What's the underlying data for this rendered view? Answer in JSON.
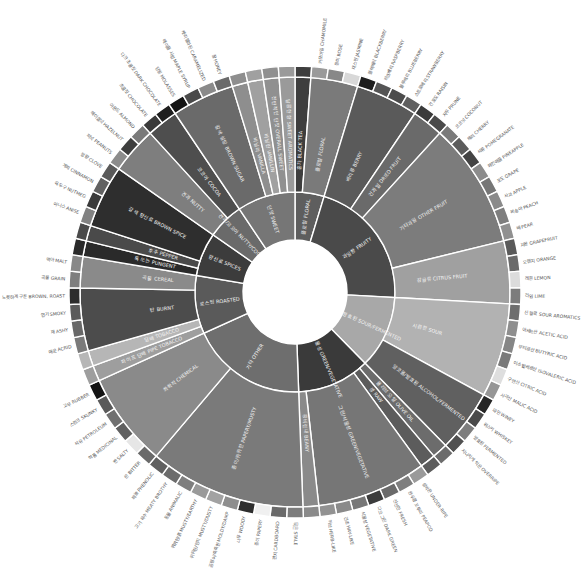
{
  "chart_data": {
    "type": "sunburst",
    "title": "",
    "center": [
      295,
      292
    ],
    "rings": {
      "hole_radius": 52,
      "inner": [
        52,
        100
      ],
      "middle": [
        100,
        215
      ],
      "outer_band": [
        215,
        226
      ],
      "label_radius": 230
    },
    "start_angle_deg": 0,
    "colors": {
      "background": "#ffffff",
      "separator": "#ffffff"
    },
    "categories": [
      {
        "ko": "플로럴",
        "en": "FLORAL",
        "color": "#5e5e5e",
        "children": [
          {
            "ko": "홍차",
            "en": "BLACK TEA",
            "color": "#3e3e3e",
            "leaves": []
          },
          {
            "ko": "플로럴",
            "en": "FLORAL",
            "color": "#7a7a7a",
            "leaves": [
              {
                "ko": "카모마일",
                "en": "CHAMOMILE",
                "color": "#9a9a9a"
              },
              {
                "ko": "장미",
                "en": "ROSE",
                "color": "#888888"
              },
              {
                "ko": "재스민",
                "en": "JASMINE",
                "color": "#d8d8d8"
              }
            ]
          }
        ]
      },
      {
        "ko": "과일향",
        "en": "FRUITY",
        "color": "#4a4a4a",
        "children": [
          {
            "ko": "베리류",
            "en": "BERRY",
            "color": "#5a5a5a",
            "leaves": [
              {
                "ko": "블랙베리",
                "en": "BLACKBERRY",
                "color": "#1e1e1e"
              },
              {
                "ko": "라즈베리",
                "en": "RASPBERRY",
                "color": "#555555"
              },
              {
                "ko": "블루베리",
                "en": "BLUEBERRY",
                "color": "#4c4c4c"
              },
              {
                "ko": "스트로베리",
                "en": "STRAWBERRY",
                "color": "#606060"
              }
            ]
          },
          {
            "ko": "건과일",
            "en": "DRIED FRUIT",
            "color": "#6a6a6a",
            "leaves": [
              {
                "ko": "건포도",
                "en": "RAISIN",
                "color": "#3a3a3a"
              },
              {
                "ko": "자두",
                "en": "PRUNE",
                "color": "#4a4a4a"
              }
            ]
          },
          {
            "ko": "기타과일",
            "en": "OTHER FRUIT",
            "color": "#7c7c7c",
            "leaves": [
              {
                "ko": "코코넛",
                "en": "COCONUT",
                "color": "#7a7a7a"
              },
              {
                "ko": "체리",
                "en": "CHERRY",
                "color": "#5c5c5c"
              },
              {
                "ko": "석류",
                "en": "POMEGRANATE",
                "color": "#444444"
              },
              {
                "ko": "파인애플",
                "en": "PINEAPPLE",
                "color": "#8c8c8c"
              },
              {
                "ko": "포도",
                "en": "GRAPE",
                "color": "#767676"
              },
              {
                "ko": "사과",
                "en": "APPLE",
                "color": "#8a8a8a"
              },
              {
                "ko": "복숭아",
                "en": "PEACH",
                "color": "#7e7e7e"
              },
              {
                "ko": "배",
                "en": "PEAR",
                "color": "#909090"
              }
            ]
          },
          {
            "ko": "감귤류",
            "en": "CITRUS FRUIT",
            "color": "#a0a0a0",
            "leaves": [
              {
                "ko": "자몽",
                "en": "GRAPEFRUIT",
                "color": "#5a5a5a"
              },
              {
                "ko": "오렌지",
                "en": "ORANGE",
                "color": "#6a6a6a"
              },
              {
                "ko": "레몬",
                "en": "LEMON",
                "color": "#dcdcdc"
              },
              {
                "ko": "라임",
                "en": "LIME",
                "color": "#7c7c7c"
              }
            ]
          }
        ]
      },
      {
        "ko": "시큼한/발효된",
        "en": "SOUR/FERMENTED",
        "color": "#a8a8a8",
        "children": [
          {
            "ko": "시큼한",
            "en": "SOUR",
            "color": "#b2b2b2",
            "leaves": [
              {
                "ko": "신 향료",
                "en": "SOUR AROMATICS",
                "color": "#6e6e6e"
              },
              {
                "ko": "아세트산",
                "en": "ACETIC ACID",
                "color": "#8e8e8e"
              },
              {
                "ko": "부티르산",
                "en": "BUTYRIC ACID",
                "color": "#868686"
              },
              {
                "ko": "이소발레르산",
                "en": "ISOVALERIC ACID",
                "color": "#7a7a7a"
              },
              {
                "ko": "구연산",
                "en": "CITRIC ACID",
                "color": "#dedede"
              },
              {
                "ko": "사과산",
                "en": "MALIC ACID",
                "color": "#969696"
              }
            ]
          },
          {
            "ko": "알코올/발효된",
            "en": "ALCOHOL/FERMENTED",
            "color": "#606060",
            "leaves": [
              {
                "ko": "와인",
                "en": "WINEY",
                "color": "#262626"
              },
              {
                "ko": "위스키",
                "en": "WHISKEY",
                "color": "#4a4a4a"
              },
              {
                "ko": "발효된",
                "en": "FERMENTED",
                "color": "#7e7e7e"
              },
              {
                "ko": "지나치게 익은",
                "en": "OVERRIPE",
                "color": "#505050"
              }
            ]
          }
        ]
      },
      {
        "ko": "그린/식물성",
        "en": "GREEN/VEGETATIVE",
        "color": "#3a3a3a",
        "children": [
          {
            "ko": "올리브 오일",
            "en": "OLIVE OIL",
            "color": "#6c6c6c",
            "leaves": []
          },
          {
            "ko": "생",
            "en": "RAW",
            "color": "#5c5c5c",
            "leaves": []
          },
          {
            "ko": "그린/식물성",
            "en": "GREEN/VEGETATIVE",
            "color": "#767676",
            "leaves": [
              {
                "ko": "설익은",
                "en": "UNDER-RIPE",
                "color": "#9a9a9a"
              },
              {
                "ko": "완두콩 꼬투리",
                "en": "PEAPOD",
                "color": "#7e7e7e"
              },
              {
                "ko": "신선한",
                "en": "FRESH",
                "color": "#6a6a6a"
              },
              {
                "ko": "다크 그린",
                "en": "DARK GREEN",
                "color": "#3c3c3c"
              },
              {
                "ko": "식물성",
                "en": "VEGETATIVE",
                "color": "#777777"
              },
              {
                "ko": "건초",
                "en": "HAY-LIKE",
                "color": "#8a8a8a"
              },
              {
                "ko": "허브",
                "en": "HERB-LIKE",
                "color": "#929292"
              }
            ]
          },
          {
            "ko": "콩비린내",
            "en": "BEANY",
            "color": "#8a8a8a",
            "leaves": []
          }
        ]
      },
      {
        "ko": "기타",
        "en": "OTHER",
        "color": "#6e6e6e",
        "children": [
          {
            "ko": "종이/퀴퀴한",
            "en": "PAPERY/MUSTY",
            "color": "#7a7a7a",
            "leaves": [
              {
                "ko": "묵은",
                "en": "STALE",
                "color": "#7c7c7c"
              },
              {
                "ko": "판지",
                "en": "CARDBOARD",
                "color": "#6a6a6a"
              },
              {
                "ko": "종이",
                "en": "PAPERY",
                "color": "#f0f0f0"
              },
              {
                "ko": "나무",
                "en": "WOODY",
                "color": "#2e2e2e"
              },
              {
                "ko": "곰팡이/축축한",
                "en": "MOLDY/DAMP",
                "color": "#8e8e8e"
              },
              {
                "ko": "퀴퀴한/먼지",
                "en": "MUSTY/DUSTY",
                "color": "#a2a2a2"
              },
              {
                "ko": "퀴퀴한/흙",
                "en": "MUSTY/EARTHY",
                "color": "#9a9a9a"
              },
              {
                "ko": "동물",
                "en": "ANIMALIC",
                "color": "#7e7e7e"
              },
              {
                "ko": "고기 육수",
                "en": "MEATY BROTHY",
                "color": "#6c6c6c"
              },
              {
                "ko": "페놀",
                "en": "PHENOLIC",
                "color": "#606060"
              }
            ]
          },
          {
            "ko": "화학적",
            "en": "CHEMICAL",
            "color": "#8a8a8a",
            "leaves": [
              {
                "ko": "쓴",
                "en": "BITTER",
                "color": "#6a6a6a"
              },
              {
                "ko": "짠",
                "en": "SALTY",
                "color": "#e6e6e6"
              },
              {
                "ko": "약품",
                "en": "MEDICINAL",
                "color": "#606060"
              },
              {
                "ko": "석유",
                "en": "PETROLEUM",
                "color": "#707070"
              },
              {
                "ko": "스컹크",
                "en": "SKUNKY",
                "color": "#5a5a5a"
              },
              {
                "ko": "고무",
                "en": "RUBBER",
                "color": "#141414"
              }
            ]
          }
        ]
      },
      {
        "ko": "로스팅",
        "en": "ROASTED",
        "color": "#5a5a5a",
        "children": [
          {
            "ko": "파이프 담배",
            "en": "PIPE TOBACCO",
            "color": "#9e9e9e",
            "leaves": []
          },
          {
            "ko": "담배",
            "en": "TOBACCO",
            "color": "#b6b6b6",
            "leaves": []
          },
          {
            "ko": "탄",
            "en": "BURNT",
            "color": "#4c4c4c",
            "leaves": [
              {
                "ko": "매운",
                "en": "ACRID",
                "color": "#7a7a7a"
              },
              {
                "ko": "재",
                "en": "ASHY",
                "color": "#686868"
              },
              {
                "ko": "연기",
                "en": "SMOKY",
                "color": "#5a5a5a"
              },
              {
                "ko": "노릇하게 구운",
                "en": "BROWN, ROAST",
                "color": "#2c2c2c"
              }
            ]
          },
          {
            "ko": "곡물",
            "en": "CEREAL",
            "color": "#8a8a8a",
            "leaves": [
              {
                "ko": "곡물",
                "en": "GRAIN",
                "color": "#7e7e7e"
              },
              {
                "ko": "맥아",
                "en": "MALT",
                "color": "#888888"
              }
            ]
          }
        ]
      },
      {
        "ko": "향신료",
        "en": "SPICES",
        "color": "#3c3c3c",
        "children": [
          {
            "ko": "톡 쏘는",
            "en": "PUNGENT",
            "color": "#2a2a2a",
            "leaves": []
          },
          {
            "ko": "후추",
            "en": "PEPPER",
            "color": "#4a4a4a",
            "leaves": []
          },
          {
            "ko": "갈색 향신료",
            "en": "BROWN SPICE",
            "color": "#2e2e2e",
            "leaves": [
              {
                "ko": "아니스",
                "en": "ANISE",
                "color": "#828282"
              },
              {
                "ko": "육두구",
                "en": "NUTMEG",
                "color": "#3a3a3a"
              },
              {
                "ko": "계피",
                "en": "CINNAMON",
                "color": "#626262"
              },
              {
                "ko": "정향",
                "en": "CLOVE",
                "color": "#5a5a5a"
              }
            ]
          }
        ]
      },
      {
        "ko": "견과/코코아",
        "en": "NUTTY/COCOA",
        "color": "#6a6a6a",
        "children": [
          {
            "ko": "견과",
            "en": "NUTTY",
            "color": "#7e7e7e",
            "leaves": [
              {
                "ko": "피넛",
                "en": "PEANUTS",
                "color": "#8c8c8c"
              },
              {
                "ko": "헤이즐넛",
                "en": "HAZELNUT",
                "color": "#3e3e3e"
              },
              {
                "ko": "아몬드",
                "en": "ALMOND",
                "color": "#7a7a7a"
              }
            ]
          },
          {
            "ko": "코코아",
            "en": "COCOA",
            "color": "#4e4e4e",
            "leaves": [
              {
                "ko": "초콜릿",
                "en": "CHOCOLATE",
                "color": "#3a3a3a"
              },
              {
                "ko": "다크 초콜릿",
                "en": "DARK CHOCOLATE",
                "color": "#1e1e1e"
              }
            ]
          }
        ]
      },
      {
        "ko": "단맛",
        "en": "SWEET",
        "color": "#767676",
        "children": [
          {
            "ko": "갈색 설탕",
            "en": "BROWN SUGAR",
            "color": "#6a6a6a",
            "leaves": [
              {
                "ko": "당밀",
                "en": "MOLASSES",
                "color": "#141414"
              },
              {
                "ko": "메이플 시럽",
                "en": "MAPLE SYRUP",
                "color": "#4a4a4a"
              },
              {
                "ko": "캐러멜화된",
                "en": "CARAMELIZED",
                "color": "#8a8a8a"
              },
              {
                "ko": "꿀",
                "en": "HONEY",
                "color": "#6a6a6a"
              }
            ]
          },
          {
            "ko": "바닐라",
            "en": "VANILLA",
            "color": "#8e8e8e",
            "leaves": []
          },
          {
            "ko": "바닐린",
            "en": "VANILLIN",
            "color": "#a0a0a0",
            "leaves": []
          },
          {
            "ko": "전반적인 단맛",
            "en": "OVERALL SWEET",
            "color": "#909090",
            "leaves": []
          },
          {
            "ko": "달콤한 향",
            "en": "SWEET AROMATICS",
            "color": "#9a9a9a",
            "leaves": []
          }
        ]
      }
    ]
  }
}
